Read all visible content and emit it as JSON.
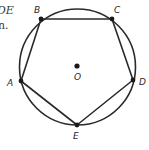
{
  "text_fragments": {
    "line1": "DE",
    "line2": "n."
  },
  "diagram": {
    "type": "inscribed-pentagon",
    "circle": {
      "center": "O",
      "cx": 77.5,
      "cy": 67,
      "r": 58
    },
    "center_label": "O",
    "vertices": [
      {
        "name": "A",
        "x": 21,
        "y": 81
      },
      {
        "name": "B",
        "x": 41,
        "y": 19
      },
      {
        "name": "C",
        "x": 112,
        "y": 19
      },
      {
        "name": "D",
        "x": 133,
        "y": 80
      },
      {
        "name": "E",
        "x": 77,
        "y": 125
      }
    ],
    "polygon_order": [
      "A",
      "B",
      "C",
      "D",
      "E"
    ],
    "stroke_color": "#2a2a2a",
    "background": "#ffffff"
  }
}
